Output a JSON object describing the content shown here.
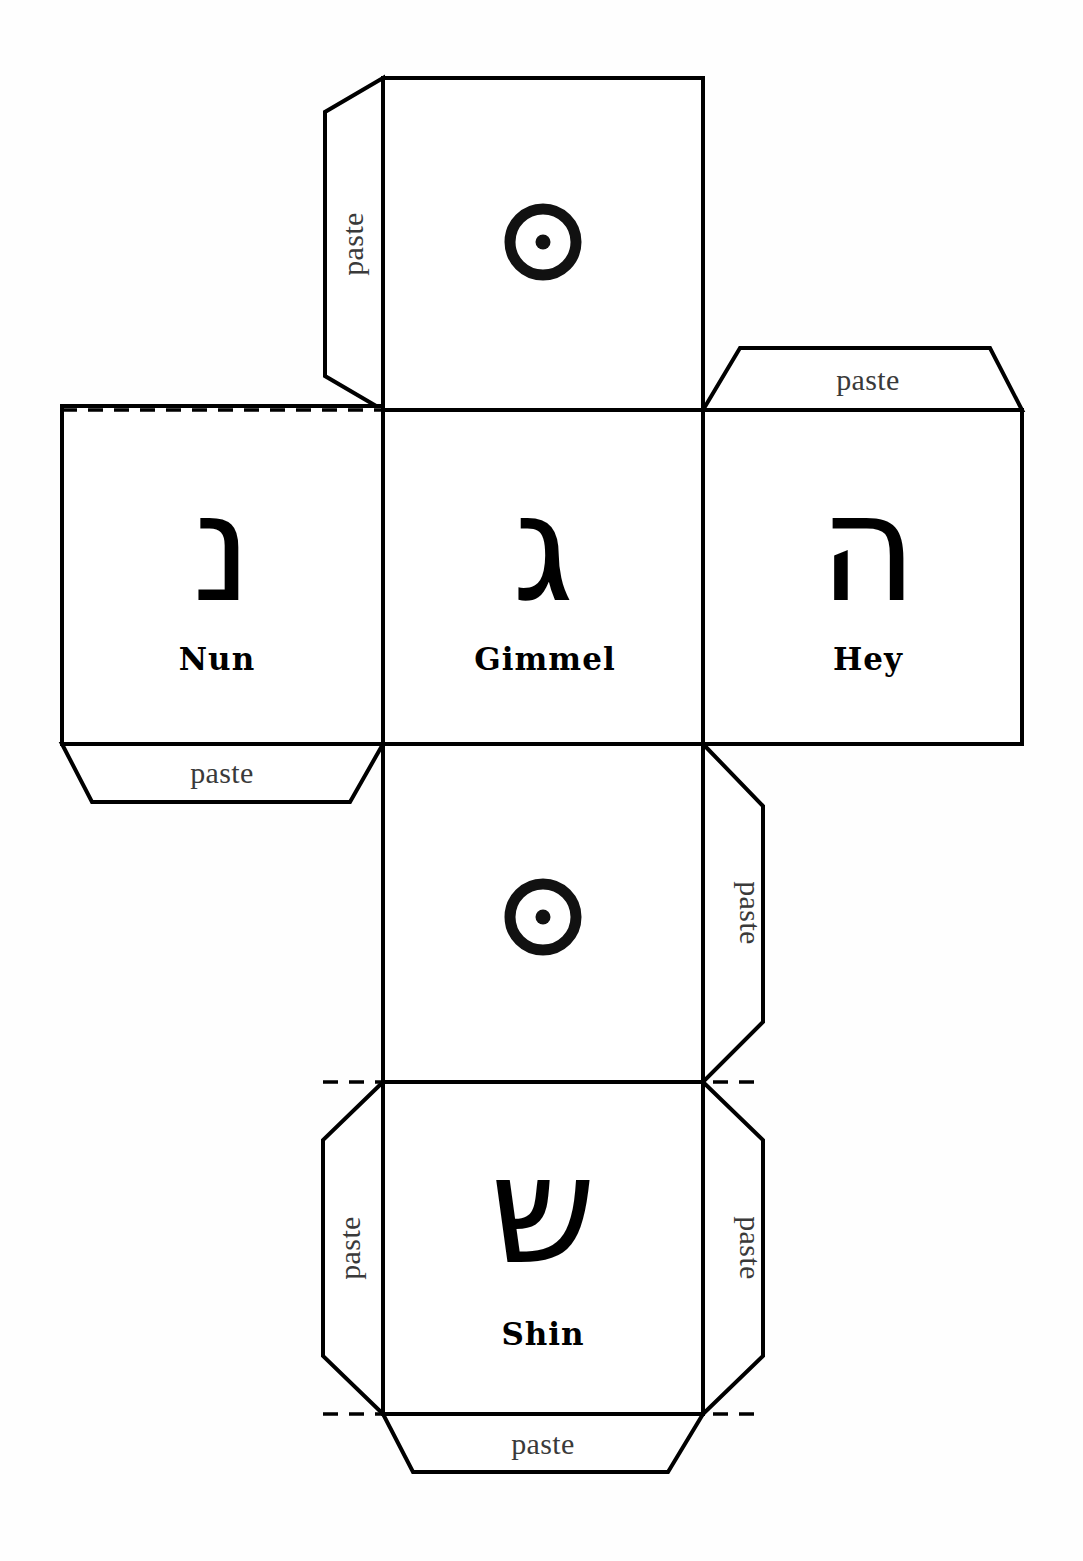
{
  "document": {
    "title": "Dreidel Cube Net",
    "description": "Printable paper cube net with Hebrew dreidel letters and paste tabs"
  },
  "faces": [
    {
      "id": "face-top",
      "symbol_type": "circle-dot",
      "hebrew": "",
      "name": ""
    },
    {
      "id": "face-nun",
      "symbol_type": "hebrew-letter",
      "hebrew": "נ",
      "name": "Nun"
    },
    {
      "id": "face-gimmel",
      "symbol_type": "hebrew-letter",
      "hebrew": "ג",
      "name": "Gimmel"
    },
    {
      "id": "face-hey",
      "symbol_type": "hebrew-letter",
      "hebrew": "ה",
      "name": "Hey"
    },
    {
      "id": "face-lower-circle",
      "symbol_type": "circle-dot",
      "hebrew": "",
      "name": ""
    },
    {
      "id": "face-shin",
      "symbol_type": "hebrew-letter",
      "hebrew": "ש",
      "name": "Shin"
    }
  ],
  "tabs": [
    {
      "id": "tab-top-left",
      "label": "paste",
      "orientation": "vertical-up"
    },
    {
      "id": "tab-hey-top",
      "label": "paste",
      "orientation": "horizontal"
    },
    {
      "id": "tab-nun-bottom",
      "label": "paste",
      "orientation": "horizontal"
    },
    {
      "id": "tab-mid-right",
      "label": "paste",
      "orientation": "vertical-down"
    },
    {
      "id": "tab-shin-left",
      "label": "paste",
      "orientation": "vertical-up"
    },
    {
      "id": "tab-shin-right",
      "label": "paste",
      "orientation": "vertical-down"
    },
    {
      "id": "tab-shin-bottom",
      "label": "paste",
      "orientation": "horizontal"
    }
  ],
  "colors": {
    "paper": "#ffffff",
    "cut_line": "#000000",
    "fold_line": "#000000",
    "ink": "#111111",
    "tab_text": "#3a3a3a"
  }
}
